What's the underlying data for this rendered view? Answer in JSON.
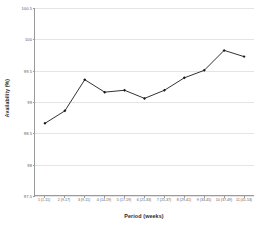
{
  "chart_data": {
    "type": "line",
    "title": "",
    "xlabel": "Period (weeks)",
    "ylabel": "Availability (%)",
    "categories": [
      "1 (1-11)",
      "2 (9-17)",
      "3 (9-11)",
      "4 (14-19)",
      "5 (17-19)",
      "6 (21-33)",
      "7 (25-37)",
      "8 (29-41)",
      "9 (33-45)",
      "10 (37-49)",
      "11 (41-53)"
    ],
    "values": [
      98.65,
      98.85,
      99.35,
      99.15,
      99.18,
      99.05,
      99.18,
      99.38,
      99.5,
      99.82,
      99.72
    ],
    "ylim": [
      97.5,
      100.5
    ],
    "ytick_labels": [
      "100.5",
      "100",
      "99.5",
      "99",
      "98.5",
      "98",
      "97.5"
    ],
    "ytick_values": [
      100.5,
      100,
      99.5,
      99,
      98.5,
      98,
      97.5
    ],
    "grid": true,
    "legend": false,
    "marker": "diamond",
    "line_color": "#1a1a1a",
    "marker_color": "#1a1a1a",
    "grid_color": "#e4e4e4",
    "axis_color": "#9a9a9a",
    "background_color": "#ffffff"
  }
}
